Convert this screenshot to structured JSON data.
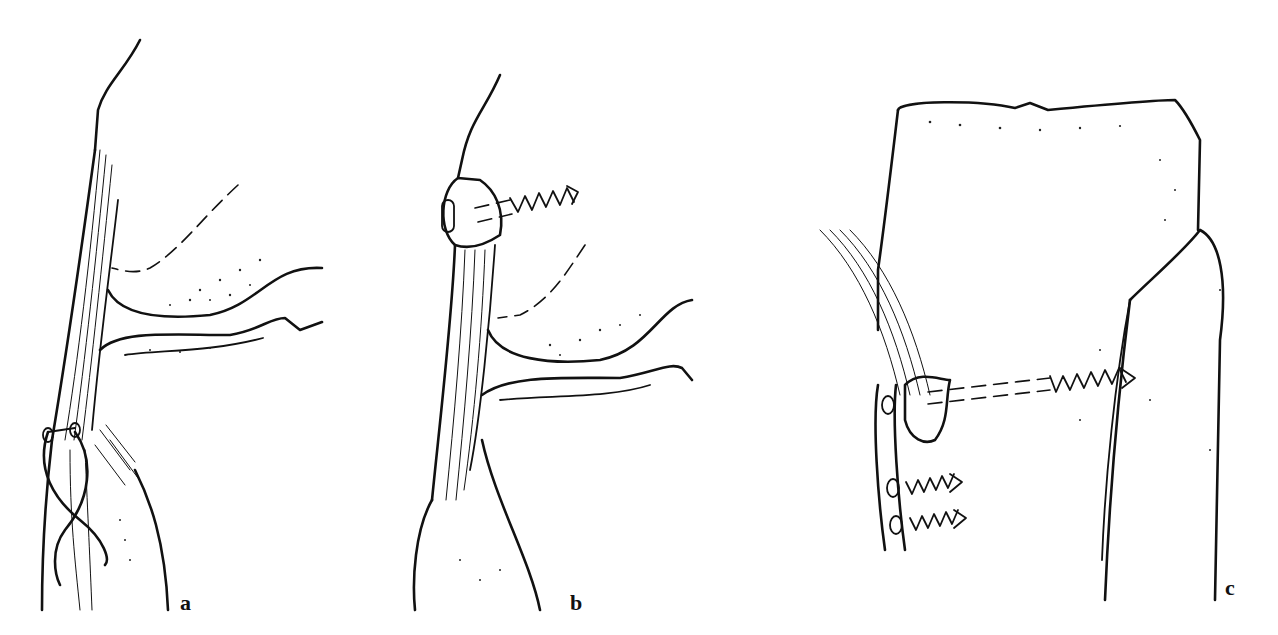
{
  "figure": {
    "panels": [
      {
        "id": "a",
        "label": "a",
        "description": "Tension band wiring (figure-of-eight) of the tibial tuberosity / patellar tendon"
      },
      {
        "id": "b",
        "label": "b",
        "description": "Screw fixation of avulsed patellar pole fragment"
      },
      {
        "id": "c",
        "label": "c",
        "description": "Plate and screw fixation of tendon insertion on tibia"
      }
    ]
  }
}
